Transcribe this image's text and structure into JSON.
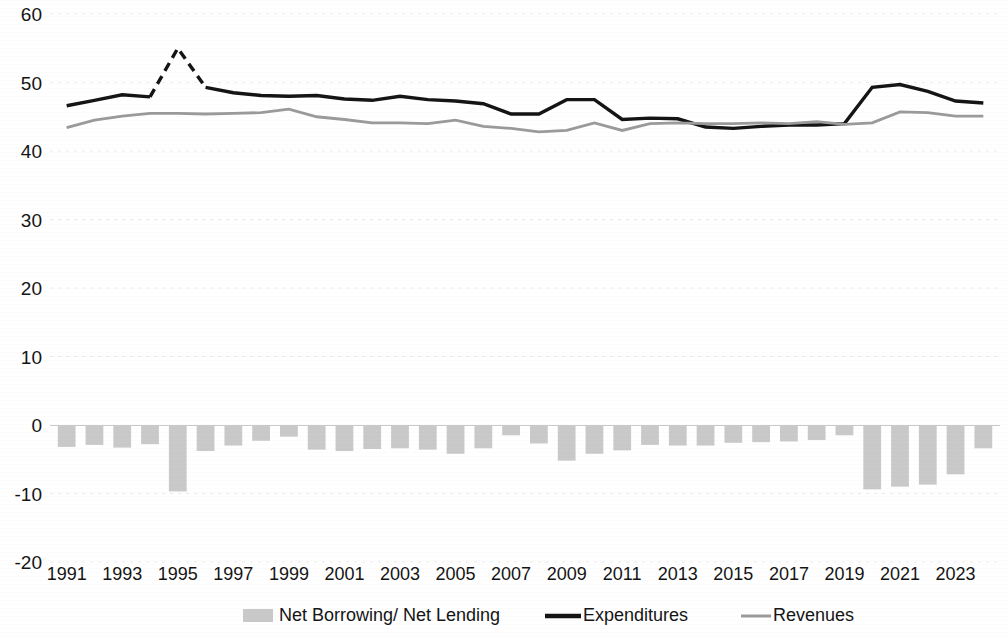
{
  "chart_data": {
    "type": "bar",
    "title": "",
    "subtitle": "",
    "xlabel": "",
    "ylabel": "",
    "xlim": [
      1990.4,
      2024.6
    ],
    "ylim": [
      -20,
      60
    ],
    "grid": true,
    "legend_position": "bottom",
    "y_ticks": [
      60,
      50,
      40,
      30,
      20,
      10,
      0,
      -10,
      -20
    ],
    "y_tick_labels": [
      "60",
      "50",
      "40",
      "30",
      "20",
      "10",
      "0",
      "-10",
      "-20"
    ],
    "x_ticks": [
      1991,
      1993,
      1995,
      1997,
      1999,
      2001,
      2003,
      2005,
      2007,
      2009,
      2011,
      2013,
      2015,
      2017,
      2019,
      2021,
      2023
    ],
    "x_tick_labels": [
      "1991",
      "1993",
      "1995",
      "1997",
      "1999",
      "2001",
      "2003",
      "2005",
      "2007",
      "2009",
      "2011",
      "2013",
      "2015",
      "2017",
      "2019",
      "2021",
      "2023"
    ],
    "x": [
      1991,
      1992,
      1993,
      1994,
      1995,
      1996,
      1997,
      1998,
      1999,
      2000,
      2001,
      2002,
      2003,
      2004,
      2005,
      2006,
      2007,
      2008,
      2009,
      2010,
      2011,
      2012,
      2013,
      2014,
      2015,
      2016,
      2017,
      2018,
      2019,
      2020,
      2021,
      2022,
      2023,
      2024
    ],
    "series": [
      {
        "name": "Net Borrowing/ Net Lending",
        "type": "bar",
        "color": "#c9c9c9",
        "values": [
          -3.2,
          -2.9,
          -3.3,
          -2.8,
          -9.7,
          -3.8,
          -3.0,
          -2.3,
          -1.7,
          -3.6,
          -3.8,
          -3.5,
          -3.4,
          -3.6,
          -4.2,
          -3.4,
          -1.5,
          -2.7,
          -5.2,
          -4.2,
          -3.7,
          -2.9,
          -3.0,
          -3.0,
          -2.6,
          -2.5,
          -2.4,
          -2.2,
          -1.5,
          -9.4,
          -9.0,
          -8.7,
          -7.2,
          -3.4
        ]
      },
      {
        "name": "Expenditures",
        "type": "line",
        "color": "#141414",
        "values": [
          46.6,
          47.4,
          48.2,
          47.9,
          55.0,
          49.3,
          48.5,
          48.1,
          48.0,
          48.1,
          47.6,
          47.4,
          48.0,
          47.5,
          47.3,
          46.9,
          45.4,
          45.4,
          47.5,
          47.5,
          44.6,
          44.8,
          44.7,
          43.5,
          43.3,
          43.6,
          43.8,
          43.8,
          44.0,
          49.3,
          49.7,
          48.7,
          47.3,
          47.0
        ]
      },
      {
        "name": "Revenues",
        "type": "line",
        "color": "#9a9a9a",
        "values": [
          43.4,
          44.5,
          45.1,
          45.5,
          45.5,
          45.4,
          45.5,
          45.6,
          46.1,
          45.0,
          44.6,
          44.1,
          44.1,
          44.0,
          44.5,
          43.6,
          43.3,
          42.8,
          43.0,
          44.1,
          43.0,
          44.0,
          44.1,
          44.0,
          44.0,
          44.1,
          44.0,
          44.3,
          43.9,
          44.1,
          45.7,
          45.6,
          45.1,
          45.1
        ]
      }
    ],
    "annotations": [
      {
        "text": "dashed segment on Expenditures between 1994 and 1996 (one-off spike)",
        "series": "Expenditures",
        "x_from": 1994,
        "x_to": 1996
      }
    ]
  },
  "legend": {
    "items": [
      {
        "label": "Net Borrowing/ Net Lending",
        "swatch": "bar-swatch",
        "color": "#c9c9c9"
      },
      {
        "label": "Expenditures",
        "swatch": "line-swatch",
        "color": "#141414"
      },
      {
        "label": "Revenues",
        "swatch": "line-swatch",
        "color": "#9a9a9a"
      }
    ]
  }
}
